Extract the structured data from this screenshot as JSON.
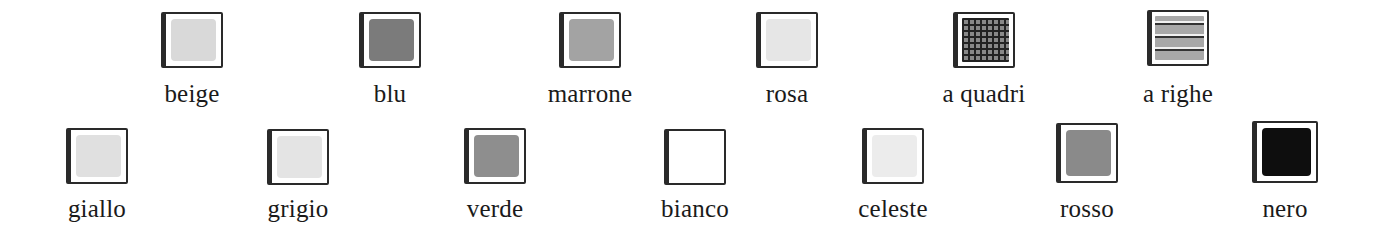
{
  "row1": [
    {
      "label": "beige",
      "swatch": "#d9d9d9",
      "pattern": "solid",
      "x": 122,
      "y": 12
    },
    {
      "label": "blu",
      "swatch": "#7b7b7b",
      "pattern": "solid",
      "x": 320,
      "y": 12
    },
    {
      "label": "marrone",
      "swatch": "#a3a3a3",
      "pattern": "solid",
      "x": 520,
      "y": 12
    },
    {
      "label": "rosa",
      "swatch": "#e6e6e6",
      "pattern": "solid",
      "x": 717,
      "y": 12
    },
    {
      "label": "a quadri",
      "swatch": "#222222",
      "pattern": "checks",
      "x": 914,
      "y": 12
    },
    {
      "label": "a righe",
      "swatch": "#a8a8a8",
      "pattern": "stripes",
      "x": 1108,
      "y": 10
    }
  ],
  "row2": [
    {
      "label": "giallo",
      "swatch": "#e0e0e0",
      "pattern": "solid",
      "x": 27,
      "y": 128
    },
    {
      "label": "grigio",
      "swatch": "#e4e4e4",
      "pattern": "solid",
      "x": 228,
      "y": 129
    },
    {
      "label": "verde",
      "swatch": "#8e8e8e",
      "pattern": "solid",
      "x": 425,
      "y": 128
    },
    {
      "label": "bianco",
      "swatch": "#ffffff",
      "pattern": "solid",
      "x": 625,
      "y": 129
    },
    {
      "label": "celeste",
      "swatch": "#ececec",
      "pattern": "solid",
      "x": 823,
      "y": 128
    },
    {
      "label": "rosso",
      "swatch": "#8a8a8a",
      "pattern": "solid",
      "x": 1017,
      "y": 123
    },
    {
      "label": "nero",
      "swatch": "#0e0e0e",
      "pattern": "solid",
      "x": 1215,
      "y": 121
    }
  ]
}
